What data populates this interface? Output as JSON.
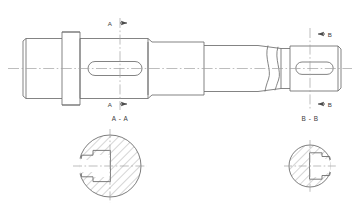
{
  "drawing": {
    "type": "mechanical-engineering-drawing",
    "subject": "stepped-shaft-with-keyways",
    "views": {
      "main": {
        "name": "front-elevation",
        "features": [
          "left-journal-with-chamfer",
          "collar-flange",
          "keyed-main-body",
          "stepped-tapers",
          "break-symbol",
          "right-journal-keyway-with-chamfer"
        ]
      }
    },
    "colors": {
      "line": "#6e6e6e",
      "line_dark": "#4a4a4a",
      "hatch": "#8a8a8a",
      "center": "#9a9a9a",
      "text": "#3a3a3a",
      "background": "#ffffff"
    },
    "section_marks": {
      "a_top": {
        "letter": "A",
        "arrow_direction": "right"
      },
      "a_bottom": {
        "letter": "A",
        "arrow_direction": "right"
      },
      "b_top": {
        "letter": "B",
        "arrow_direction": "left"
      },
      "b_bottom": {
        "letter": "B",
        "arrow_direction": "left"
      }
    },
    "section_views": [
      {
        "id": "section-a-a",
        "title": "A - A",
        "shape": "circle",
        "diameter_px": 62,
        "keyway_side": "left",
        "hatched": true,
        "hatch_angle_deg": 45
      },
      {
        "id": "section-b-b",
        "title": "B - B",
        "shape": "circle",
        "diameter_px": 42,
        "keyway_side": "right",
        "hatched": true,
        "hatch_angle_deg": 45
      }
    ]
  }
}
